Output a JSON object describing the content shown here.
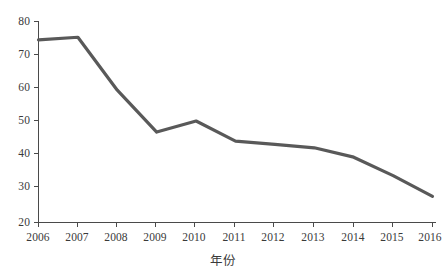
{
  "chart_data": {
    "type": "line",
    "title": "",
    "subtitle": "",
    "xlabel": "年份",
    "ylabel": "",
    "categories": [
      "2006",
      "2007",
      "2008",
      "2009",
      "2010",
      "2011",
      "2012",
      "2013",
      "2014",
      "2015",
      "2016"
    ],
    "x": [
      2006,
      2007,
      2008,
      2009,
      2010,
      2011,
      2012,
      2013,
      2014,
      2015,
      2016
    ],
    "values": [
      74.5,
      75.3,
      59.5,
      47.0,
      50.3,
      44.3,
      43.3,
      42.3,
      39.5,
      34.0,
      27.8
    ],
    "series": [
      {
        "name": "",
        "values": [
          74.5,
          75.3,
          59.5,
          47.0,
          50.3,
          44.3,
          43.3,
          42.3,
          39.5,
          34.0,
          27.8
        ]
      }
    ],
    "xlim": [
      2006,
      2016
    ],
    "ylim": [
      20,
      80
    ],
    "yticks": [
      20,
      30,
      40,
      50,
      60,
      70,
      80
    ],
    "ytick_labels": [
      "20",
      "30",
      "40",
      "50",
      "60",
      "70",
      "80"
    ],
    "xtick_labels": [
      "2006",
      "2007",
      "2008",
      "2009",
      "2010",
      "2011",
      "2012",
      "2013",
      "2014",
      "2015",
      "2016"
    ],
    "grid": false,
    "legend": null,
    "legend_position": "none",
    "annotations": [],
    "colors": {
      "line": "#595959",
      "axis": "#4a4a4a",
      "text": "#3a3a3a",
      "background": "#ffffff"
    },
    "line_width": 3.2,
    "markers": false
  }
}
